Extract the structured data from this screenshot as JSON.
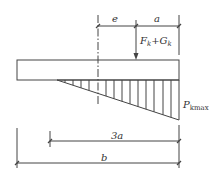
{
  "diagram": {
    "type": "foundation base pressure diagram",
    "labels": {
      "eccentricity": "e",
      "edge_distance": "a",
      "load_main": "F",
      "load_main_sub": "k",
      "load_plus": "+",
      "load_second": "G",
      "load_second_sub": "k",
      "pressure_main": "P",
      "pressure_sub": "kmax",
      "pressure_length": "3a",
      "width": "b"
    },
    "colors": {
      "line": "#444444",
      "background": "#ffffff"
    }
  }
}
